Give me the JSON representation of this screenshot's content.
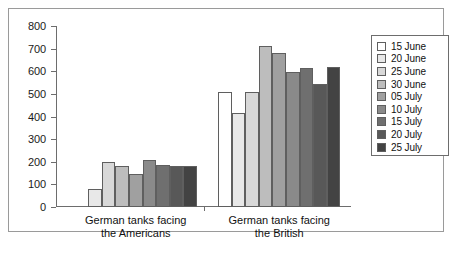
{
  "chart_data": {
    "type": "bar",
    "title": "",
    "subtitle": "",
    "xlabel": "",
    "ylabel": "",
    "ylim": [
      0,
      800
    ],
    "ytick_step": 100,
    "yticks": [
      0,
      100,
      200,
      300,
      400,
      500,
      600,
      700,
      800
    ],
    "grid": false,
    "legend_position": "right",
    "orientation": "vertical",
    "grouping": "clustered",
    "categories": [
      "German tanks facing\nthe Americans",
      "German tanks facing\nthe British"
    ],
    "series": [
      {
        "name": "15 June",
        "color": "#ffffff",
        "values": [
          null,
          510
        ]
      },
      {
        "name": "20 June",
        "color": "#e8e8e8",
        "values": [
          78,
          415
        ]
      },
      {
        "name": "25 June",
        "color": "#d8d8d8",
        "values": [
          200,
          510
        ]
      },
      {
        "name": "30 June",
        "color": "#bdbdbd",
        "values": [
          180,
          710
        ]
      },
      {
        "name": "05 July",
        "color": "#a0a0a0",
        "values": [
          145,
          680
        ]
      },
      {
        "name": "10 July",
        "color": "#8a8a8a",
        "values": [
          210,
          595
        ]
      },
      {
        "name": "15 July",
        "color": "#6f6f6f",
        "values": [
          185,
          615
        ]
      },
      {
        "name": "20 July",
        "color": "#585858",
        "values": [
          182,
          545
        ]
      },
      {
        "name": "25 July",
        "color": "#434343",
        "values": [
          180,
          620
        ]
      }
    ]
  },
  "legend": {
    "items": [
      {
        "label": "15 June",
        "color": "#ffffff"
      },
      {
        "label": "20 June",
        "color": "#e8e8e8"
      },
      {
        "label": "25 June",
        "color": "#d8d8d8"
      },
      {
        "label": "30 June",
        "color": "#bdbdbd"
      },
      {
        "label": "05 July",
        "color": "#a0a0a0"
      },
      {
        "label": "10 July",
        "color": "#8a8a8a"
      },
      {
        "label": "15 July",
        "color": "#6f6f6f"
      },
      {
        "label": "20 July",
        "color": "#585858"
      },
      {
        "label": "25 July",
        "color": "#434343"
      }
    ]
  },
  "axis": {
    "y_tick_labels": [
      "800",
      "700",
      "600",
      "500",
      "400",
      "300",
      "200",
      "100",
      "0"
    ]
  }
}
